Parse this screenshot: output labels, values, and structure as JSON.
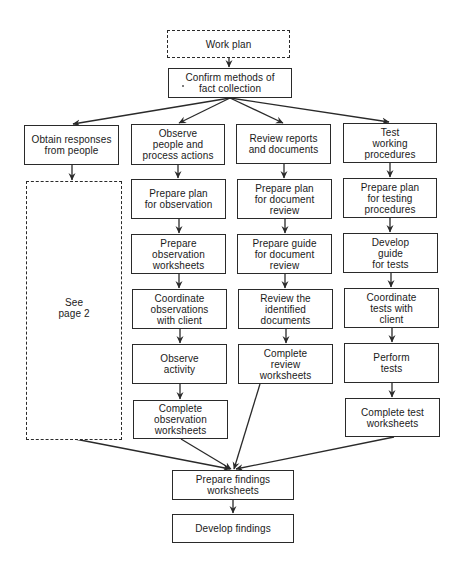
{
  "diagram": {
    "type": "flowchart",
    "colors": {
      "line": "#2a2a2a",
      "background": "#ffffff",
      "text": "#1a1a1a"
    },
    "nodes": {
      "work_plan": {
        "label": "Work plan",
        "style": "dashed"
      },
      "confirm_methods": {
        "label": "Confirm methods of\nfact collection",
        "style": "solid"
      },
      "obtain_responses": {
        "label": "Obtain responses\nfrom people",
        "style": "solid"
      },
      "see_page_2": {
        "label": "See\npage 2",
        "style": "dashed"
      },
      "observe_people": {
        "label": "Observe\npeople and\nprocess actions",
        "style": "solid"
      },
      "prepare_plan_observation": {
        "label": "Prepare plan\nfor observation",
        "style": "solid"
      },
      "prepare_observation_worksheets": {
        "label": "Prepare\nobservation\nworksheets",
        "style": "solid"
      },
      "coordinate_observations": {
        "label": "Coordinate\nobservations\nwith client",
        "style": "solid"
      },
      "observe_activity": {
        "label": "Observe\nactivity",
        "style": "solid"
      },
      "complete_observation_worksheets": {
        "label": "Complete\nobservation\nworksheets",
        "style": "solid"
      },
      "review_reports": {
        "label": "Review reports\nand documents",
        "style": "solid"
      },
      "prepare_plan_document_review": {
        "label": "Prepare plan\nfor document\nreview",
        "style": "solid"
      },
      "prepare_guide_document_review": {
        "label": "Prepare guide\nfor document\nreview",
        "style": "solid"
      },
      "review_identified_documents": {
        "label": "Review the\nidentified\ndocuments",
        "style": "solid"
      },
      "complete_review_worksheets": {
        "label": "Complete\nreview\nworksheets",
        "style": "solid"
      },
      "test_procedures": {
        "label": "Test\nworking\nprocedures",
        "style": "solid"
      },
      "prepare_plan_testing": {
        "label": "Prepare plan\nfor testing\nprocedures",
        "style": "solid"
      },
      "develop_guide_tests": {
        "label": "Develop\nguide\nfor tests",
        "style": "solid"
      },
      "coordinate_tests": {
        "label": "Coordinate\ntests with\nclient",
        "style": "solid"
      },
      "perform_tests": {
        "label": "Perform\ntests",
        "style": "solid"
      },
      "complete_test_worksheets": {
        "label": "Complete test\nworksheets",
        "style": "solid"
      },
      "prepare_findings_worksheets": {
        "label": "Prepare findings\nworksheets",
        "style": "solid"
      },
      "develop_findings": {
        "label": "Develop findings",
        "style": "solid"
      }
    },
    "edges": [
      [
        "work_plan",
        "confirm_methods"
      ],
      [
        "confirm_methods",
        "obtain_responses"
      ],
      [
        "confirm_methods",
        "observe_people"
      ],
      [
        "confirm_methods",
        "review_reports"
      ],
      [
        "confirm_methods",
        "test_procedures"
      ],
      [
        "obtain_responses",
        "see_page_2"
      ],
      [
        "observe_people",
        "prepare_plan_observation"
      ],
      [
        "prepare_plan_observation",
        "prepare_observation_worksheets"
      ],
      [
        "prepare_observation_worksheets",
        "coordinate_observations"
      ],
      [
        "coordinate_observations",
        "observe_activity"
      ],
      [
        "observe_activity",
        "complete_observation_worksheets"
      ],
      [
        "review_reports",
        "prepare_plan_document_review"
      ],
      [
        "prepare_plan_document_review",
        "prepare_guide_document_review"
      ],
      [
        "prepare_guide_document_review",
        "review_identified_documents"
      ],
      [
        "review_identified_documents",
        "complete_review_worksheets"
      ],
      [
        "test_procedures",
        "prepare_plan_testing"
      ],
      [
        "prepare_plan_testing",
        "develop_guide_tests"
      ],
      [
        "develop_guide_tests",
        "coordinate_tests"
      ],
      [
        "coordinate_tests",
        "perform_tests"
      ],
      [
        "perform_tests",
        "complete_test_worksheets"
      ],
      [
        "see_page_2",
        "prepare_findings_worksheets"
      ],
      [
        "complete_observation_worksheets",
        "prepare_findings_worksheets"
      ],
      [
        "complete_review_worksheets",
        "prepare_findings_worksheets"
      ],
      [
        "complete_test_worksheets",
        "prepare_findings_worksheets"
      ],
      [
        "prepare_findings_worksheets",
        "develop_findings"
      ]
    ]
  }
}
